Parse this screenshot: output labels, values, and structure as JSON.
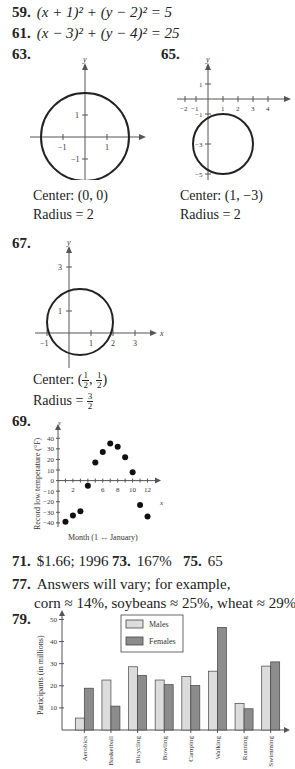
{
  "answers": {
    "a59": {
      "num": "59.",
      "text": "(x + 1)² + (y − 2)² = 5"
    },
    "a61": {
      "num": "61.",
      "text": "(x − 3)² + (y − 4)² = 25"
    },
    "a63": {
      "num": "63.",
      "center": "Center: (0, 0)",
      "radius": "Radius = 2",
      "graph": {
        "xlabel": "x",
        "ylabel": "y",
        "xticks": [
          "−1",
          "1"
        ],
        "yticks": [
          "1",
          "−1"
        ]
      }
    },
    "a65": {
      "num": "65.",
      "center": "Center: (1, −3)",
      "radius": "Radius = 2",
      "graph": {
        "xlabel": "x",
        "ylabel": "y",
        "xticks": [
          "−2",
          "−1",
          "1",
          "2",
          "3",
          "4"
        ],
        "yticks": [
          "1",
          "−1",
          "−3",
          "−5"
        ]
      }
    },
    "a67": {
      "num": "67.",
      "center_prefix": "Center: ",
      "center_frac": [
        "1",
        "2",
        "1",
        "2"
      ],
      "radius_prefix": "Radius = ",
      "radius_frac": [
        "3",
        "2"
      ],
      "graph": {
        "xlabel": "x",
        "ylabel": "y",
        "xticks": [
          "−1",
          "1",
          "2",
          "3"
        ],
        "yticks": [
          "3",
          "1"
        ]
      }
    },
    "a69": {
      "num": "69."
    },
    "a71": {
      "num": "71.",
      "text": "$1.66; 1996"
    },
    "a73": {
      "num": "73.",
      "text": "167%"
    },
    "a75": {
      "num": "75.",
      "text": "65"
    },
    "a77": {
      "num": "77.",
      "line1": "Answers will vary; for example,",
      "line2": "corn ≈ 14%, soybeans ≈ 25%, wheat ≈ 29%."
    },
    "a79": {
      "num": "79."
    }
  },
  "chart_data": [
    {
      "type": "scatter",
      "title": "",
      "xlabel": "Month (1 ↔ January)",
      "ylabel": "Record low temperature (°F)",
      "x_axis_letter": "x",
      "y_axis_letter": "y",
      "x": [
        1,
        2,
        3,
        4,
        5,
        6,
        7,
        8,
        9,
        10,
        11,
        12
      ],
      "y": [
        -39,
        -33,
        -29,
        -5,
        17,
        27,
        35,
        32,
        22,
        8,
        -23,
        -34
      ],
      "xlim": [
        0,
        13
      ],
      "ylim": [
        -42,
        45
      ],
      "xticklabels": [
        "2",
        "6",
        "8",
        "10",
        "12"
      ],
      "yticklabels": [
        "40",
        "30",
        "20",
        "10",
        "0",
        "−10",
        "−20",
        "−30",
        "−40"
      ],
      "grid": false
    },
    {
      "type": "bar",
      "title": "",
      "xlabel": "",
      "ylabel": "Participants (in millions)",
      "categories": [
        "Aerobics",
        "Basketball",
        "Bicycling",
        "Bowling",
        "Camping",
        "Walking",
        "Running",
        "Swimming"
      ],
      "series": [
        {
          "name": "Males",
          "color": "#dcdcdc",
          "values": [
            5.4,
            22.6,
            28.6,
            22.6,
            24.2,
            26.6,
            12.0,
            28.9
          ]
        },
        {
          "name": "Females",
          "color": "#8c8c8c",
          "values": [
            18.9,
            10.8,
            24.7,
            20.5,
            20.1,
            46.4,
            9.6,
            30.8
          ]
        }
      ],
      "ylim": [
        0,
        52
      ],
      "yticklabels": [
        "10",
        "20",
        "30",
        "40",
        "50"
      ],
      "legend": "top-center",
      "grid": false
    }
  ]
}
